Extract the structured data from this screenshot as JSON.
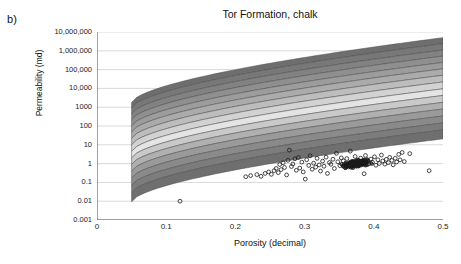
{
  "panel": {
    "label": "b)"
  },
  "chart_data": {
    "type": "scatter",
    "title": "Tor Formation, chalk",
    "xlabel": "Porosity (decimal)",
    "ylabel": "Permeability (md)",
    "xlim": [
      0,
      0.5
    ],
    "ylim": [
      0.001,
      10000000
    ],
    "yscale": "log",
    "xscale": "linear",
    "grid": true,
    "legend": null,
    "xticks": [
      0,
      0.1,
      0.2,
      0.3,
      0.4,
      0.5
    ],
    "xtick_labels": [
      "0",
      "0.1",
      "0.2",
      "0.3",
      "0.4",
      "0.5"
    ],
    "yticks": [
      0.001,
      0.01,
      0.1,
      1,
      10,
      100,
      1000,
      10000,
      100000,
      1000000,
      10000000
    ],
    "ytick_labels": [
      "10,000,000",
      "1,000,000",
      "100,000",
      "10,000",
      "1000",
      "100",
      "10",
      "1",
      "0.1",
      "0.01",
      "0.001"
    ],
    "bands": {
      "description": "Greyscale contour bands of modelled permeability vs porosity, log-linear rising trend spanning porosity 0.05 to 0.5",
      "x_start": 0.05,
      "x_end": 0.5,
      "band_colors": [
        "#6e6e6e",
        "#787878",
        "#828282",
        "#8f8f8f",
        "#9c9c9c",
        "#ababab",
        "#bdbdbd",
        "#d2d2d2",
        "#e4e4e4",
        "#c9c9c9",
        "#b0b0b0",
        "#9a9a9a",
        "#8a8a8a",
        "#7c7c7c",
        "#6f6f6f"
      ],
      "band_top_at_x005": [
        1800,
        900,
        440,
        210,
        100,
        48,
        22,
        10,
        4.5,
        2.0,
        0.9,
        0.4,
        0.17,
        0.07,
        0.028
      ],
      "band_top_at_x050": [
        5000000,
        2400000,
        1100000,
        520000,
        240000,
        110000,
        50000,
        22000,
        9500,
        4200,
        1800,
        800,
        340,
        145,
        62
      ]
    },
    "series": [
      {
        "name": "core measurements",
        "marker": "open-circle",
        "color": "#1a1a1a",
        "n_points": 420,
        "x_range": [
          0.12,
          0.48
        ],
        "y_range": [
          0.01,
          6
        ],
        "cluster_center": [
          0.375,
          1.0
        ],
        "points": [
          [
            0.12,
            0.01
          ],
          [
            0.215,
            0.2
          ],
          [
            0.222,
            0.23
          ],
          [
            0.231,
            0.26
          ],
          [
            0.237,
            0.21
          ],
          [
            0.243,
            0.3
          ],
          [
            0.248,
            0.36
          ],
          [
            0.252,
            0.27
          ],
          [
            0.256,
            0.42
          ],
          [
            0.259,
            0.55
          ],
          [
            0.262,
            0.33
          ],
          [
            0.264,
            0.9
          ],
          [
            0.266,
            0.48
          ],
          [
            0.269,
            1.1
          ],
          [
            0.271,
            0.62
          ],
          [
            0.274,
            0.25
          ],
          [
            0.276,
            1.5
          ],
          [
            0.278,
            5.2
          ],
          [
            0.281,
            0.7
          ],
          [
            0.283,
            0.95
          ],
          [
            0.286,
            1.8
          ],
          [
            0.288,
            0.44
          ],
          [
            0.291,
            2.1
          ],
          [
            0.293,
            0.58
          ],
          [
            0.296,
            1.2
          ],
          [
            0.298,
            0.36
          ],
          [
            0.301,
            0.15
          ],
          [
            0.303,
            1.6
          ],
          [
            0.306,
            0.8
          ],
          [
            0.308,
            2.6
          ],
          [
            0.311,
            0.5
          ],
          [
            0.313,
            1.05
          ],
          [
            0.316,
            0.65
          ],
          [
            0.318,
            1.9
          ],
          [
            0.321,
            0.85
          ],
          [
            0.323,
            0.4
          ],
          [
            0.326,
            1.35
          ],
          [
            0.328,
            0.72
          ],
          [
            0.331,
            2.2
          ],
          [
            0.333,
            0.3
          ],
          [
            0.336,
            1.15
          ],
          [
            0.338,
            0.92
          ],
          [
            0.341,
            1.7
          ],
          [
            0.343,
            0.55
          ],
          [
            0.346,
            3.5
          ],
          [
            0.348,
            1.25
          ],
          [
            0.351,
            0.78
          ],
          [
            0.353,
            2.0
          ],
          [
            0.356,
            1.4
          ],
          [
            0.358,
            0.66
          ],
          [
            0.361,
            1.85
          ],
          [
            0.363,
            1.0
          ],
          [
            0.366,
            4.6
          ],
          [
            0.368,
            1.3
          ],
          [
            0.371,
            0.88
          ],
          [
            0.373,
            2.4
          ],
          [
            0.376,
            1.55
          ],
          [
            0.378,
            0.74
          ],
          [
            0.381,
            1.95
          ],
          [
            0.383,
            1.08
          ],
          [
            0.386,
            0.29
          ],
          [
            0.388,
            2.7
          ],
          [
            0.391,
            1.45
          ],
          [
            0.393,
            0.96
          ],
          [
            0.396,
            1.75
          ],
          [
            0.398,
            1.18
          ],
          [
            0.401,
            2.3
          ],
          [
            0.403,
            0.82
          ],
          [
            0.406,
            1.6
          ],
          [
            0.408,
            1.02
          ],
          [
            0.411,
            2.85
          ],
          [
            0.413,
            1.38
          ],
          [
            0.416,
            0.94
          ],
          [
            0.418,
            1.68
          ],
          [
            0.421,
            1.12
          ],
          [
            0.423,
            2.15
          ],
          [
            0.426,
            1.48
          ],
          [
            0.428,
            0.86
          ],
          [
            0.431,
            1.92
          ],
          [
            0.433,
            1.22
          ],
          [
            0.436,
            3.1
          ],
          [
            0.438,
            1.58
          ],
          [
            0.441,
            3.9
          ],
          [
            0.444,
            1.28
          ],
          [
            0.452,
            3.4
          ],
          [
            0.48,
            0.42
          ]
        ]
      }
    ]
  }
}
